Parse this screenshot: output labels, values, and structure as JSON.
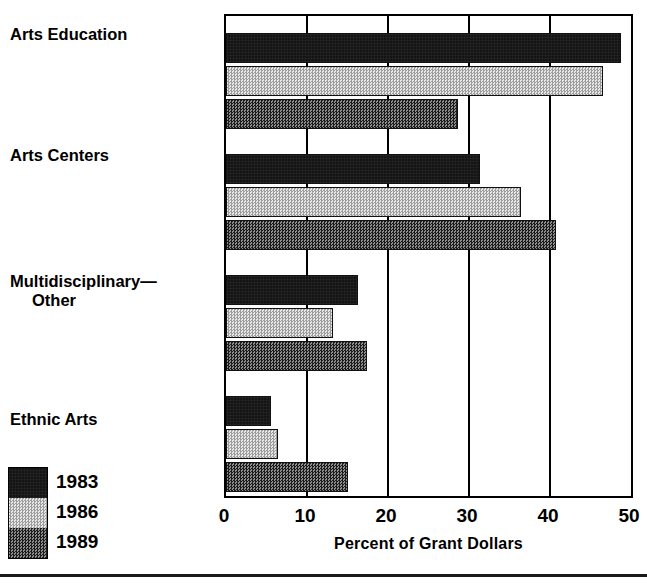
{
  "chart_data": {
    "type": "bar",
    "orientation": "horizontal",
    "title": "",
    "xlabel": "Percent of Grant Dollars",
    "ylabel": "",
    "xlim": [
      0,
      50
    ],
    "xticks": [
      0,
      10,
      20,
      30,
      40,
      50
    ],
    "xticklabels": [
      "0",
      "10",
      "20",
      "30",
      "40",
      "50"
    ],
    "grid": true,
    "legend_position": "bottom-left",
    "categories": [
      "Arts Education",
      "Arts Centers",
      "Multidisciplinary—\nOther",
      "Ethnic Arts"
    ],
    "series": [
      {
        "name": "1983",
        "color": "#141414",
        "pattern": "solid-dark",
        "values": [
          48.8,
          31.4,
          16.3,
          5.5
        ]
      },
      {
        "name": "1986",
        "color": "#d9d9d9",
        "pattern": "light-checker",
        "values": [
          46.5,
          36.4,
          13.2,
          6.4
        ]
      },
      {
        "name": "1989",
        "color": "#585858",
        "pattern": "dark-checker",
        "values": [
          28.6,
          40.8,
          17.4,
          15.1
        ]
      }
    ]
  },
  "legend": {
    "items": [
      {
        "label": "1983"
      },
      {
        "label": "1986"
      },
      {
        "label": "1989"
      }
    ]
  }
}
